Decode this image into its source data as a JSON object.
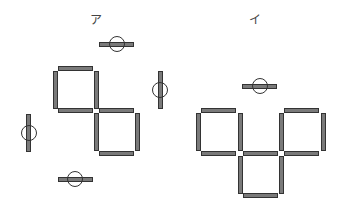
{
  "figures": [
    {
      "label": "ア",
      "description": "two squares touching at a corner; loose matches around with circled markers"
    },
    {
      "label": "イ",
      "description": "three squares arranged in a V/cup shape; one loose circled match above"
    }
  ],
  "colors": {
    "stick_fill": "#7a7a7a",
    "stick_border": "#333333",
    "background": "#ffffff"
  }
}
